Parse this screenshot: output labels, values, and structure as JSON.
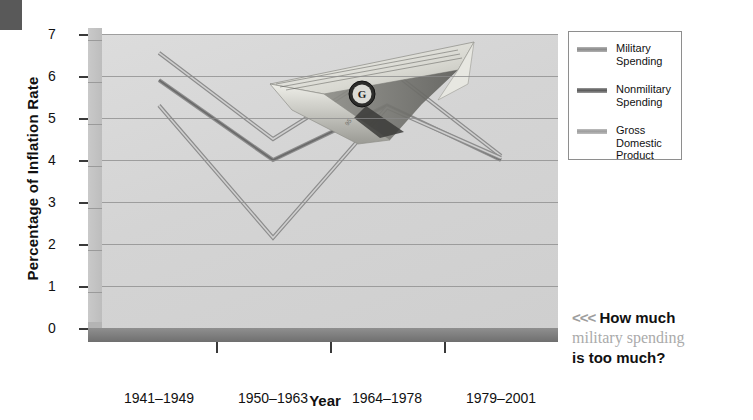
{
  "corner_mark": {
    "name": "page-corner-mark"
  },
  "chart_data": {
    "type": "line",
    "title": "",
    "xlabel": "Year",
    "ylabel": "Percentage of Inflation Rate",
    "categories": [
      "1941–1949",
      "1950–1963",
      "1964–1978",
      "1979–2001"
    ],
    "ylim": [
      0,
      7
    ],
    "yticks": [
      "7",
      "6",
      "5",
      "4",
      "3",
      "2",
      "1",
      "0"
    ],
    "grid": true,
    "legend_position": "right",
    "series": [
      {
        "name": "Military Spending",
        "values": [
          6.55,
          4.5,
          6.2,
          4.1
        ]
      },
      {
        "name": "Nonmilitary Spending",
        "values": [
          5.9,
          4.0,
          5.3,
          4.0
        ]
      },
      {
        "name": "Gross Domestic Product",
        "values": [
          5.3,
          2.15,
          5.25,
          4.05
        ]
      }
    ]
  },
  "legend": {
    "items": [
      {
        "label_line1": "Military",
        "label_line2": "Spending",
        "label_line3": ""
      },
      {
        "label_line1": "Nonmilitary",
        "label_line2": "Spending",
        "label_line3": ""
      },
      {
        "label_line1": "Gross",
        "label_line2": "Domestic",
        "label_line3": "Product"
      }
    ]
  },
  "callout": {
    "chevrons": "<<<",
    "line1": "How much",
    "line2": "military spending",
    "line3": "is too much?"
  },
  "image": {
    "name": "dollar-bill-paper-airplane"
  },
  "colors": {
    "plot_background": "#d6d6d6",
    "wall": "#c4c4c4",
    "floor": "#7d7d7d",
    "gridline": "#8a8a8a",
    "series_line": "#6e6e6e",
    "text": "#111111",
    "muted_text": "#aaaaaa"
  }
}
